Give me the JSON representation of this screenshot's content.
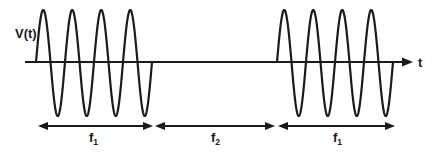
{
  "diagram": {
    "type": "frequency-shift-keyed signal waveform",
    "y_axis_label": "V(t)",
    "x_axis_label": "t",
    "axis": {
      "y": 62,
      "x_start": 25,
      "x_end": 413
    },
    "amplitude": {
      "peak_y": 10,
      "trough_y": 116
    },
    "bursts": [
      {
        "name": "burst-1",
        "x_start": 36,
        "cycles": 4,
        "period_px": 29,
        "end_rise_x": 153
      },
      {
        "name": "burst-2",
        "x_start": 277,
        "cycles": 4,
        "period_px": 29,
        "end_rise_x": 395
      }
    ],
    "segments": [
      {
        "label_main": "f",
        "label_sub": "1",
        "x_start": 38,
        "x_end": 153,
        "label_x": 93
      },
      {
        "label_main": "f",
        "label_sub": "2",
        "x_start": 155,
        "x_end": 275,
        "label_x": 215
      },
      {
        "label_main": "f",
        "label_sub": "1",
        "x_start": 278,
        "x_end": 395,
        "label_x": 337
      }
    ],
    "dimension_y": 126,
    "label_y": 142,
    "colors": {
      "stroke": "#1a1a1a",
      "background": "#ffffff"
    }
  }
}
